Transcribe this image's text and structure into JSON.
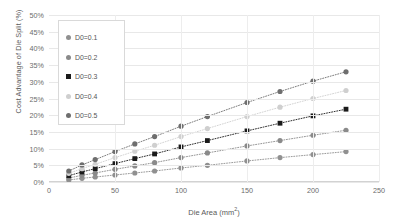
{
  "chart_data": {
    "type": "line",
    "title": "",
    "xlabel": "Die Area (mm²)",
    "ylabel": "Cost Advantage of Die Split (%)",
    "xlim": [
      0,
      250
    ],
    "ylim": [
      0,
      50
    ],
    "grid": true,
    "legend_position": "top-left",
    "x": [
      15,
      25,
      35,
      50,
      65,
      80,
      100,
      120,
      150,
      175,
      200,
      225
    ],
    "xticks": [
      0,
      50,
      100,
      150,
      200,
      250
    ],
    "yticks": [
      "0%",
      "5%",
      "10%",
      "15%",
      "20%",
      "25%",
      "30%",
      "35%",
      "40%",
      "45%",
      "50%"
    ],
    "ytick_values": [
      0,
      5,
      10,
      15,
      20,
      25,
      30,
      35,
      40,
      45,
      50
    ],
    "series": [
      {
        "name": "D0=0.1",
        "color": "#909090",
        "marker": "circle",
        "values": [
          0.6,
          1.1,
          1.5,
          2.1,
          2.7,
          3.3,
          4.2,
          5.0,
          6.3,
          7.3,
          8.2,
          9.1
        ]
      },
      {
        "name": "D0=0.2",
        "color": "#8a8a8a",
        "marker": "circle",
        "values": [
          1.2,
          2.0,
          2.7,
          3.8,
          4.8,
          5.8,
          7.3,
          8.7,
          10.8,
          12.4,
          14.0,
          15.5
        ]
      },
      {
        "name": "D0=0.3",
        "color": "#1a1a1a",
        "marker": "square",
        "values": [
          1.9,
          3.0,
          4.0,
          5.5,
          7.0,
          8.4,
          10.5,
          12.4,
          15.3,
          17.6,
          19.8,
          21.8
        ]
      },
      {
        "name": "D0=0.4",
        "color": "#cfcfcf",
        "marker": "circle",
        "values": [
          2.6,
          4.0,
          5.3,
          7.3,
          9.2,
          11.0,
          13.6,
          16.0,
          19.6,
          22.4,
          25.0,
          27.4
        ]
      },
      {
        "name": "D0=0.5",
        "color": "#6e6e6e",
        "marker": "circle",
        "values": [
          3.3,
          5.1,
          6.7,
          9.1,
          11.4,
          13.6,
          16.7,
          19.6,
          23.8,
          27.1,
          30.2,
          33.0
        ]
      }
    ]
  }
}
